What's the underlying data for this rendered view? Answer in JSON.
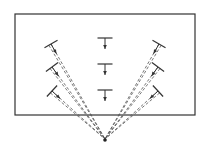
{
  "diagram": {
    "stroke_color": "#333333",
    "frame": {
      "x": 15,
      "y": 14,
      "width": 180,
      "height": 101
    },
    "focal_point": {
      "x": 105,
      "y": 140
    },
    "markers": [
      {
        "group": "left",
        "x": 51,
        "y": 44,
        "angle": -27,
        "dashed": true
      },
      {
        "group": "left",
        "x": 52,
        "y": 67,
        "angle": -34,
        "dashed": true
      },
      {
        "group": "left",
        "x": 52,
        "y": 91,
        "angle": -40,
        "dashed": true
      },
      {
        "group": "center",
        "x": 105,
        "y": 38,
        "angle": 0,
        "dashed": false
      },
      {
        "group": "center",
        "x": 105,
        "y": 64,
        "angle": 0,
        "dashed": false
      },
      {
        "group": "center",
        "x": 105,
        "y": 90,
        "angle": 0,
        "dashed": false
      },
      {
        "group": "right",
        "x": 159,
        "y": 44,
        "angle": 27,
        "dashed": true
      },
      {
        "group": "right",
        "x": 158,
        "y": 67,
        "angle": 34,
        "dashed": true
      },
      {
        "group": "right",
        "x": 158,
        "y": 91,
        "angle": 40,
        "dashed": true
      }
    ]
  }
}
